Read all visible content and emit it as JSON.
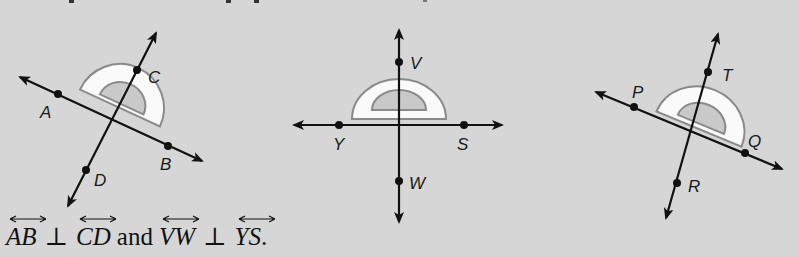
{
  "colors": {
    "background": "#d6d6d6",
    "line": "#111111",
    "protractor_fill": "#fafafa",
    "protractor_stroke": "#8a8a8a",
    "inner_arc": "#c9c9c9"
  },
  "figures": [
    {
      "id": "figure-1",
      "lines": [
        {
          "name": "AB",
          "from": [
            20,
            77
          ],
          "to": [
            202,
            161
          ]
        },
        {
          "name": "CD",
          "from": [
            156,
            33
          ],
          "to": [
            68,
            206
          ]
        }
      ],
      "points": [
        {
          "label": "A",
          "at": [
            58,
            94
          ],
          "label_at": [
            40,
            118
          ]
        },
        {
          "label": "B",
          "at": [
            168,
            146
          ],
          "label_at": [
            160,
            170
          ]
        },
        {
          "label": "C",
          "at": [
            137,
            70
          ],
          "label_at": [
            148,
            83
          ]
        },
        {
          "label": "D",
          "at": [
            86,
            170
          ],
          "label_at": [
            94,
            186
          ]
        }
      ]
    },
    {
      "id": "figure-2",
      "lines": [
        {
          "name": "VW",
          "from": [
            399,
            30
          ],
          "to": [
            399,
            222
          ]
        },
        {
          "name": "YS",
          "from": [
            294,
            125
          ],
          "to": [
            502,
            125
          ]
        }
      ],
      "points": [
        {
          "label": "V",
          "at": [
            399,
            62
          ],
          "label_at": [
            410,
            69
          ]
        },
        {
          "label": "W",
          "at": [
            399,
            181
          ],
          "label_at": [
            409,
            189
          ]
        },
        {
          "label": "Y",
          "at": [
            339,
            125
          ],
          "label_at": [
            333,
            150
          ]
        },
        {
          "label": "S",
          "at": [
            464,
            125
          ],
          "label_at": [
            457,
            150
          ]
        }
      ]
    },
    {
      "id": "figure-3",
      "lines": [
        {
          "name": "PQ",
          "from": [
            596,
            92
          ],
          "to": [
            782,
            169
          ]
        },
        {
          "name": "TR",
          "from": [
            718,
            34
          ],
          "to": [
            666,
            218
          ]
        }
      ],
      "points": [
        {
          "label": "P",
          "at": [
            634,
            107
          ],
          "label_at": [
            632,
            98
          ]
        },
        {
          "label": "Q",
          "at": [
            745,
            153
          ],
          "label_at": [
            748,
            147
          ]
        },
        {
          "label": "T",
          "at": [
            708,
            72
          ],
          "label_at": [
            722,
            81
          ]
        },
        {
          "label": "R",
          "at": [
            677,
            183
          ],
          "label_at": [
            688,
            192
          ]
        }
      ]
    }
  ],
  "labels": {
    "A": "A",
    "B": "B",
    "C": "C",
    "D": "D",
    "V": "V",
    "W": "W",
    "Y": "Y",
    "S": "S",
    "P": "P",
    "Q": "Q",
    "T": "T",
    "R": "R"
  },
  "caption": {
    "line1": "AB",
    "perp1": "⊥",
    "line2": "CD",
    "conj": "and",
    "line3": "VW",
    "perp2": "⊥",
    "line4": "YS",
    "end": "."
  }
}
